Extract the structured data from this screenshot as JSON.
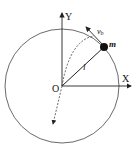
{
  "diagram": {
    "labels": {
      "y_axis": "Y",
      "x_axis": "X",
      "origin": "O",
      "mass": "m",
      "length": "l",
      "velocity": "v",
      "velocity_sub": "b"
    },
    "colors": {
      "stroke": "#222222",
      "background": "#ffffff"
    }
  }
}
